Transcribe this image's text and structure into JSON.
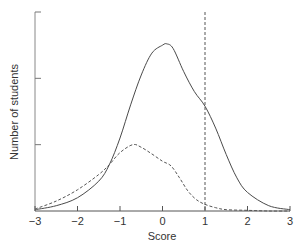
{
  "chart_data": {
    "type": "line",
    "title": "",
    "xlabel": "Score",
    "ylabel": "Number of students",
    "xlim": [
      -3,
      3
    ],
    "ylim": [
      0,
      3
    ],
    "xticks": [
      -3,
      -2,
      -1,
      0,
      1,
      2,
      3
    ],
    "xtick_labels": [
      "−3",
      "−2",
      "−1",
      "0",
      "1",
      "2",
      "3"
    ],
    "yticks": [
      0,
      1,
      2,
      3
    ],
    "ytick_labels": [
      "",
      "",
      "",
      ""
    ],
    "grid": false,
    "legend": null,
    "annotations": [
      {
        "type": "vline",
        "x": 1,
        "style": "dashed"
      }
    ],
    "series": [
      {
        "name": "solid",
        "style": "solid",
        "x": [
          -3,
          -2.5,
          -2,
          -1.5,
          -1.25,
          -1,
          -0.75,
          -0.5,
          -0.25,
          0,
          0.1,
          0.25,
          0.5,
          0.75,
          1,
          1.25,
          1.5,
          1.75,
          2,
          2.5,
          3
        ],
        "y": [
          0.02,
          0.08,
          0.2,
          0.45,
          0.7,
          1.1,
          1.6,
          2.05,
          2.38,
          2.5,
          2.52,
          2.45,
          2.1,
          1.8,
          1.58,
          1.25,
          0.85,
          0.5,
          0.28,
          0.08,
          0.02
        ]
      },
      {
        "name": "dashed",
        "style": "dashed",
        "x": [
          -3,
          -2.5,
          -2,
          -1.5,
          -1.25,
          -1,
          -0.7,
          -0.5,
          -0.25,
          0,
          0.2,
          0.4,
          0.6,
          0.8,
          1,
          1.25,
          1.5,
          2,
          2.5,
          3
        ],
        "y": [
          0.03,
          0.15,
          0.32,
          0.55,
          0.7,
          0.88,
          1.0,
          0.96,
          0.86,
          0.75,
          0.68,
          0.5,
          0.3,
          0.17,
          0.1,
          0.05,
          0.02,
          0.01,
          0.0,
          0.0
        ]
      }
    ]
  }
}
